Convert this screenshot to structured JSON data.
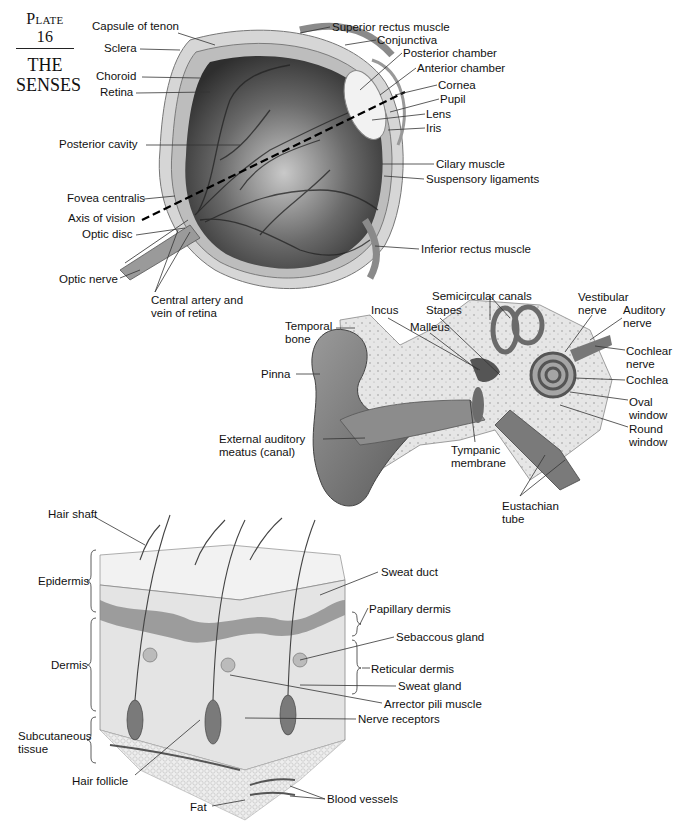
{
  "header": {
    "plate_number": "Plate 16",
    "title": "THE\nSENSES"
  },
  "eye": {
    "labels": [
      {
        "id": "capsule-of-tenon",
        "text": "Capsule of tenon",
        "x": 92,
        "y": 26
      },
      {
        "id": "sclera",
        "text": "Sclera",
        "x": 104,
        "y": 42
      },
      {
        "id": "choroid",
        "text": "Choroid",
        "x": 96,
        "y": 70
      },
      {
        "id": "retina",
        "text": "Retina",
        "x": 100,
        "y": 86
      },
      {
        "id": "posterior-cavity",
        "text": "Posterior cavity",
        "x": 59,
        "y": 138
      },
      {
        "id": "fovea-centralis",
        "text": "Fovea centralis",
        "x": 67,
        "y": 192
      },
      {
        "id": "axis-of-vision",
        "text": "Axis of vision",
        "x": 68,
        "y": 212
      },
      {
        "id": "optic-disc",
        "text": "Optic disc",
        "x": 82,
        "y": 228
      },
      {
        "id": "optic-nerve",
        "text": "Optic nerve",
        "x": 59,
        "y": 273
      },
      {
        "id": "central-artery",
        "text": "Central artery and\nvein of retina",
        "x": 151,
        "y": 294
      },
      {
        "id": "superior-rectus-muscle",
        "text": "Superior rectus muscle",
        "x": 332,
        "y": 21
      },
      {
        "id": "conjunctiva",
        "text": "Conjunctiva",
        "x": 377,
        "y": 34
      },
      {
        "id": "posterior-chamber",
        "text": "Posterior chamber",
        "x": 403,
        "y": 47
      },
      {
        "id": "anterior-chamber",
        "text": "Anterior chamber",
        "x": 417,
        "y": 62
      },
      {
        "id": "cornea",
        "text": "Cornea",
        "x": 438,
        "y": 79
      },
      {
        "id": "pupil",
        "text": "Pupil",
        "x": 440,
        "y": 93
      },
      {
        "id": "lens",
        "text": "Lens",
        "x": 426,
        "y": 108
      },
      {
        "id": "iris",
        "text": "Iris",
        "x": 426,
        "y": 122
      },
      {
        "id": "cilary-muscle",
        "text": "Cilary muscle",
        "x": 436,
        "y": 158
      },
      {
        "id": "suspensory-ligaments",
        "text": "Suspensory ligaments",
        "x": 426,
        "y": 173
      },
      {
        "id": "inferior-rectus-muscle",
        "text": "Inferior rectus muscle",
        "x": 421,
        "y": 243
      }
    ]
  },
  "ear": {
    "labels": [
      {
        "id": "semicircular-canals",
        "text": "Semicircular canals",
        "x": 432,
        "y": 290
      },
      {
        "id": "incus",
        "text": "Incus",
        "x": 371,
        "y": 304
      },
      {
        "id": "stapes",
        "text": "Stapes",
        "x": 426,
        "y": 304
      },
      {
        "id": "malleus",
        "text": "Malleus",
        "x": 410,
        "y": 321
      },
      {
        "id": "temporal-bone",
        "text": "Temporal\nbone",
        "x": 285,
        "y": 320
      },
      {
        "id": "vestibular-nerve",
        "text": "Vestibular\nnerve",
        "x": 578,
        "y": 291
      },
      {
        "id": "auditory-nerve",
        "text": "Auditory\nnerve",
        "x": 623,
        "y": 304
      },
      {
        "id": "pinna",
        "text": "Pinna",
        "x": 261,
        "y": 368
      },
      {
        "id": "cochlear-nerve",
        "text": "Cochlear\nnerve",
        "x": 626,
        "y": 345
      },
      {
        "id": "cochlea",
        "text": "Cochlea",
        "x": 626,
        "y": 374
      },
      {
        "id": "oval-window",
        "text": "Oval\nwindow",
        "x": 629,
        "y": 396
      },
      {
        "id": "round-window",
        "text": "Round\nwindow",
        "x": 629,
        "y": 423
      },
      {
        "id": "external-auditory-meatus",
        "text": "External auditory\nmeatus (canal)",
        "x": 219,
        "y": 433
      },
      {
        "id": "tympanic-membrane",
        "text": "Tympanic\nmembrane",
        "x": 451,
        "y": 444
      },
      {
        "id": "eustachian-tube",
        "text": "Eustachian\ntube",
        "x": 502,
        "y": 500
      }
    ]
  },
  "skin": {
    "labels": [
      {
        "id": "hair-shaft",
        "text": "Hair shaft",
        "x": 48,
        "y": 508
      },
      {
        "id": "epidermis",
        "text": "Epidermis",
        "x": 38,
        "y": 575
      },
      {
        "id": "dermis",
        "text": "Dermis",
        "x": 51,
        "y": 659
      },
      {
        "id": "subcutaneous-tissue",
        "text": "Subcutaneous\ntissue",
        "x": 18,
        "y": 730
      },
      {
        "id": "hair-follicle",
        "text": "Hair follicle",
        "x": 72,
        "y": 775
      },
      {
        "id": "fat",
        "text": "Fat",
        "x": 190,
        "y": 801
      },
      {
        "id": "sweat-duct",
        "text": "Sweat duct",
        "x": 381,
        "y": 566
      },
      {
        "id": "papillary-dermis",
        "text": "Papillary dermis",
        "x": 369,
        "y": 603
      },
      {
        "id": "sebaccous-gland",
        "text": "Sebaccous gland",
        "x": 396,
        "y": 631
      },
      {
        "id": "reticular-dermis",
        "text": "Reticular dermis",
        "x": 371,
        "y": 663
      },
      {
        "id": "sweat-gland",
        "text": "Sweat gland",
        "x": 398,
        "y": 680
      },
      {
        "id": "arrector-pili-muscle",
        "text": "Arrector pili muscle",
        "x": 384,
        "y": 698
      },
      {
        "id": "nerve-receptors",
        "text": "Nerve receptors",
        "x": 358,
        "y": 713
      },
      {
        "id": "blood-vessels",
        "text": "Blood vessels",
        "x": 327,
        "y": 793
      }
    ]
  }
}
